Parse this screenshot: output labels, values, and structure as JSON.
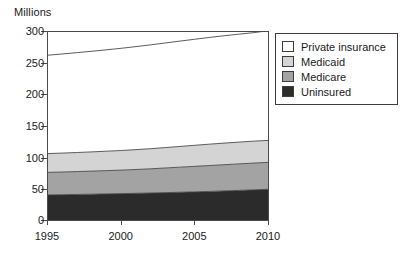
{
  "chart_data": {
    "type": "area",
    "title": "",
    "subtitle": "",
    "xlabel": "",
    "ylabel": "Millions",
    "ylabel_position": "above-axis-left",
    "stacked": true,
    "grid": false,
    "legend_position": "right-outside-top",
    "x": [
      1995,
      1996,
      1997,
      1998,
      1999,
      2000,
      2001,
      2002,
      2003,
      2004,
      2005,
      2006,
      2007,
      2008,
      2009,
      2010
    ],
    "xlim": [
      1995,
      2010
    ],
    "ylim": [
      0,
      300
    ],
    "xticks": [
      1995,
      2000,
      2005,
      2010
    ],
    "xtick_labels": [
      "1995",
      "2000",
      "2005",
      "2010"
    ],
    "yticks": [
      0,
      50,
      100,
      150,
      200,
      250,
      300
    ],
    "ytick_labels": [
      "0",
      "50",
      "100",
      "150",
      "200",
      "250",
      "300"
    ],
    "series": [
      {
        "name": "Uninsured",
        "color": "#2b2b2b",
        "stack_order": 1,
        "values": [
          40,
          40.4,
          40.8,
          41.2,
          41.7,
          42.1,
          42.6,
          43.1,
          43.7,
          44.3,
          44.9,
          45.6,
          46.4,
          47.2,
          48.1,
          49
        ]
      },
      {
        "name": "Medicare",
        "color": "#a3a3a3",
        "stack_order": 2,
        "values": [
          36,
          36.2,
          36.5,
          36.8,
          37.1,
          37.5,
          38,
          38.6,
          39.3,
          40,
          40.7,
          41.3,
          41.8,
          42.3,
          42.7,
          43
        ]
      },
      {
        "name": "Medicaid",
        "color": "#d4d4d4",
        "stack_order": 3,
        "values": [
          30,
          30.2,
          30.4,
          30.7,
          31,
          31.3,
          31.7,
          32.1,
          32.6,
          33.1,
          33.6,
          34.1,
          34.5,
          34.8,
          35,
          35
        ]
      },
      {
        "name": "Private insurance",
        "color": "#ffffff",
        "stack_order": 4,
        "values": [
          157,
          158.2,
          159.4,
          160.6,
          161.8,
          163.1,
          164.4,
          165.7,
          166.9,
          168.1,
          169.2,
          170.3,
          171.3,
          172.2,
          173.1,
          175
        ]
      }
    ],
    "cumulative_top_boundaries": {
      "uninsured": [
        40,
        40.4,
        40.8,
        41.2,
        41.7,
        42.1,
        42.6,
        43.1,
        43.7,
        44.3,
        44.9,
        45.6,
        46.4,
        47.2,
        48.1,
        49
      ],
      "medicare": [
        76,
        76.6,
        77.3,
        78,
        78.8,
        79.6,
        80.6,
        81.7,
        83,
        84.3,
        85.6,
        86.9,
        88.2,
        89.5,
        90.8,
        92
      ],
      "medicaid": [
        106,
        106.8,
        107.7,
        108.7,
        109.8,
        110.9,
        112.3,
        113.8,
        115.6,
        117.4,
        119.2,
        121,
        122.7,
        124.3,
        125.8,
        127
      ],
      "total": [
        263,
        265,
        267.1,
        269.3,
        271.6,
        274,
        276.7,
        279.5,
        282.5,
        285.5,
        288.4,
        291.3,
        294,
        296.5,
        298.9,
        302
      ]
    },
    "annotations": []
  },
  "legend": {
    "items": [
      {
        "label": "Private insurance",
        "color": "#ffffff"
      },
      {
        "label": "Medicaid",
        "color": "#d4d4d4"
      },
      {
        "label": "Medicare",
        "color": "#a3a3a3"
      },
      {
        "label": "Uninsured",
        "color": "#2b2b2b"
      }
    ]
  },
  "axes": {
    "y_title": "Millions",
    "y_tick_labels": [
      "300",
      "250",
      "200",
      "150",
      "100",
      "50",
      "0"
    ],
    "x_tick_labels": [
      "1995",
      "2000",
      "2005",
      "2010"
    ]
  }
}
